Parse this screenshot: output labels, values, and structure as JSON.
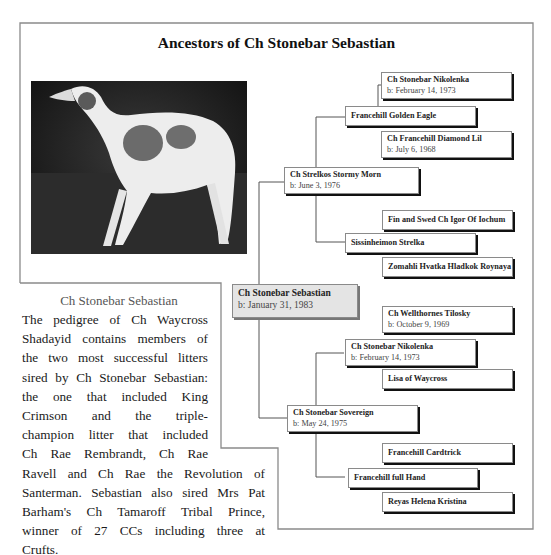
{
  "figure": {
    "title": "Ancestors of Ch Stonebar Sebastian",
    "photo": {
      "subject": "borzoi-photo",
      "description": "Black and white photograph of a white borzoi with dark patches, standing in profile"
    }
  },
  "pedigree": {
    "subject": {
      "name": "Ch Stonebar Sebastian",
      "born": "b: January 31, 1983"
    },
    "sire": {
      "name": "Ch Strelkos Stormy Morn",
      "born": "b: June 3, 1976"
    },
    "dam": {
      "name": "Ch Stonebar Sovereign",
      "born": "b: May 24, 1975"
    },
    "sire_sire": {
      "name": "Francehill Golden Eagle"
    },
    "sire_dam": {
      "name": "Sissinheimon Strelka"
    },
    "dam_sire": {
      "name": "Ch Stonebar Nikolenka",
      "born": "b: February 14, 1973"
    },
    "dam_dam": {
      "name": "Francehill full Hand"
    },
    "ss_sire": {
      "name": "Ch Stonebar Nikolenka",
      "born": "b: February 14, 1973"
    },
    "ss_dam": {
      "name": "Ch Francehill Diamond Lil",
      "born": "b: July 6, 1968"
    },
    "sd_sire": {
      "name": "Fin and Swed Ch Igor Of Iochum"
    },
    "sd_dam": {
      "name": "Zomahli Hvatka Hladkok Roynaya"
    },
    "ds_sire": {
      "name": "Ch Wellthornes Tilosky",
      "born": "b: October 9, 1969"
    },
    "ds_dam": {
      "name": "Lisa of Waycross"
    },
    "dd_sire": {
      "name": "Francehill Cardtrick"
    },
    "dd_dam": {
      "name": "Reyas Helena  Kristina"
    }
  },
  "caption": {
    "title": "Ch Stonebar Sebastian",
    "lines": [
      "The pedigree of Ch Waycross",
      "Shadayid contains members of",
      "the two most successful litters",
      "sired by Ch Stonebar Sebastian:",
      "the one that included King",
      "Crimson and the triple-",
      "champion litter that included",
      "Ch Rae Rembrandt, Ch Rae",
      "Ravell and Ch Rae the Revolution of",
      "Santerman. Sebastian also sired Mrs Pat",
      "Barham's Ch Tamaroff Tribal Prince,",
      "winner of 27 CCs including three at",
      "Crufts."
    ]
  },
  "colors": {
    "frame": "#8a8a8a",
    "connector": "#555555",
    "root_box": "#e4e4e4",
    "box_shadow": "#111111",
    "caption_title": "#555555"
  }
}
